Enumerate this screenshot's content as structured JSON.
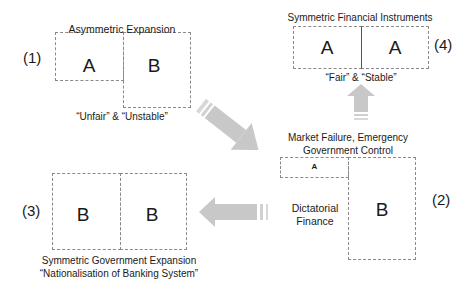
{
  "panel1": {
    "number": "(1)",
    "title": "Asymmetric Expansion",
    "box_left": "A",
    "box_right": "B",
    "caption": "“Unfair” & “Unstable”"
  },
  "panel2": {
    "number": "(2)",
    "title_line1": "Market Failure, Emergency",
    "title_line2": "Government Control",
    "small_box": "A",
    "big_box": "B",
    "side_label_line1": "Dictatorial",
    "side_label_line2": "Finance"
  },
  "panel3": {
    "number": "(3)",
    "box_left": "B",
    "box_right": "B",
    "caption_line1": "Symmetric Government Expansion",
    "caption_line2": "“Nationalisation of Banking System”"
  },
  "panel4": {
    "number": "(4)",
    "title": "Symmetric Financial Instruments",
    "box_left": "A",
    "box_right": "A",
    "caption": "“Fair” & “Stable”"
  },
  "arrows": {
    "color": "#c8c8c8",
    "flow": [
      "panel1-to-panel2",
      "panel2-to-panel3",
      "panel2-to-panel4"
    ]
  }
}
